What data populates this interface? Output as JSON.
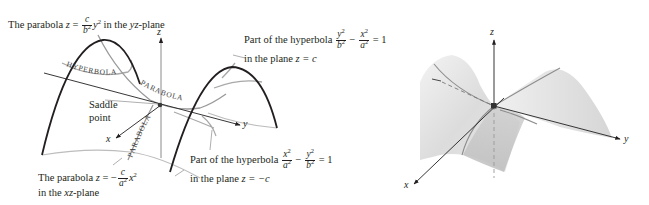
{
  "figure": {
    "type": "hyperbolic-paraboloid-saddle",
    "left_panel": {
      "annotations": {
        "yz_parabola": {
          "prefix": "The parabola ",
          "eq_lhs": "z",
          "eq_sign": " = ",
          "frac_num": "c",
          "frac_den": "b",
          "den_exp": "2",
          "var": "y",
          "var_exp": "2",
          "suffix_pre": " in the ",
          "plane": "yz",
          "suffix_post": "-plane"
        },
        "hyperbola_top": {
          "line1_prefix": "Part of the hyperbola ",
          "frac1_num": "y",
          "frac1_num_exp": "2",
          "frac1_den": "b",
          "frac1_den_exp": "2",
          "minus": " − ",
          "frac2_num": "x",
          "frac2_num_exp": "2",
          "frac2_den": "a",
          "frac2_den_exp": "2",
          "rhs": " = 1",
          "line2_prefix": "in the plane ",
          "line2_eq": "z = c"
        },
        "saddle_point": {
          "line1": "Saddle",
          "line2": "point"
        },
        "xz_parabola": {
          "prefix": "The parabola ",
          "eq_lhs": "z",
          "eq_sign": " = −",
          "frac_num": "c",
          "frac_den": "a",
          "den_exp": "2",
          "var": "x",
          "var_exp": "2",
          "line2_prefix": "in the ",
          "plane": "xz",
          "line2_suffix": "-plane"
        },
        "hyperbola_bottom": {
          "line1_prefix": "Part of the hyperbola ",
          "frac1_num": "x",
          "frac1_num_exp": "2",
          "frac1_den": "a",
          "frac1_den_exp": "2",
          "minus": " − ",
          "frac2_num": "y",
          "frac2_num_exp": "2",
          "frac2_den": "b",
          "frac2_den_exp": "2",
          "rhs": " = 1",
          "line2_prefix": "in the plane ",
          "line2_eq": "z = −c"
        }
      },
      "curve_labels": [
        "HYPERBOLA",
        "PARABOLA",
        "PARABOLA"
      ],
      "axes": {
        "x": "x",
        "y": "y",
        "z": "z"
      }
    },
    "right_panel": {
      "axes": {
        "x": "x",
        "y": "y",
        "z": "z"
      }
    },
    "colors": {
      "ink": "#231f20",
      "curve_gray": "#9a9a9a",
      "surface_light": "#ededed",
      "surface_mid": "#d9d9d9",
      "surface_dark": "#c4c4c4"
    }
  }
}
